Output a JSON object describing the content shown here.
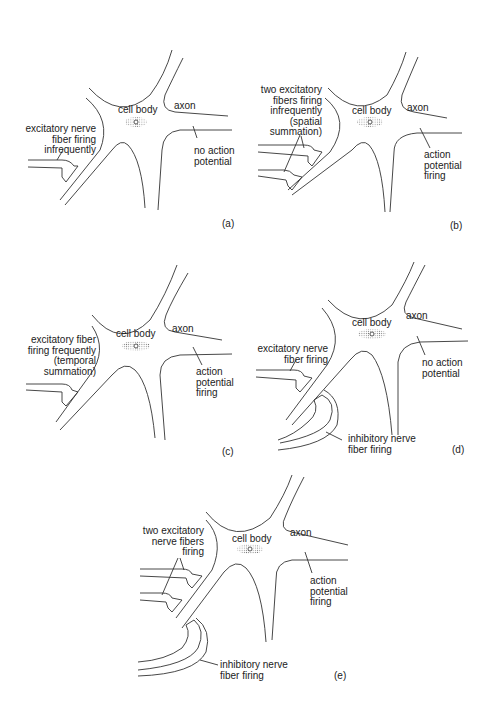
{
  "figure": {
    "panels": [
      {
        "id": "a",
        "tag": "(a)",
        "cell_body": "cell body",
        "axon": "axon",
        "input_label": "excitatory nerve\nfiber firing\ninfrequently",
        "output_label": "no action\npotential"
      },
      {
        "id": "b",
        "tag": "(b)",
        "cell_body": "cell body",
        "axon": "axon",
        "input_label": "two excitatory\nfibers firing\ninfrequently\n(spatial\nsummation)",
        "output_label": "action\npotential\nfiring"
      },
      {
        "id": "c",
        "tag": "(c)",
        "cell_body": "cell body",
        "axon": "axon",
        "input_label": "excitatory fiber\nfiring frequently\n(temporal\nsummation)",
        "output_label": "action\npotential\nfiring"
      },
      {
        "id": "d",
        "tag": "(d)",
        "cell_body": "cell body",
        "axon": "axon",
        "input_label": "excitatory nerve\nfiber firing",
        "inhibitory_label": "inhibitory nerve\nfiber firing",
        "output_label": "no action\npotential"
      },
      {
        "id": "e",
        "tag": "(e)",
        "cell_body": "cell body",
        "axon": "axon",
        "input_label": "two excitatory\nnerve fibers\nfiring",
        "inhibitory_label": "inhibitory nerve\nfiber firing",
        "output_label": "action\npotential\nfiring"
      }
    ]
  }
}
